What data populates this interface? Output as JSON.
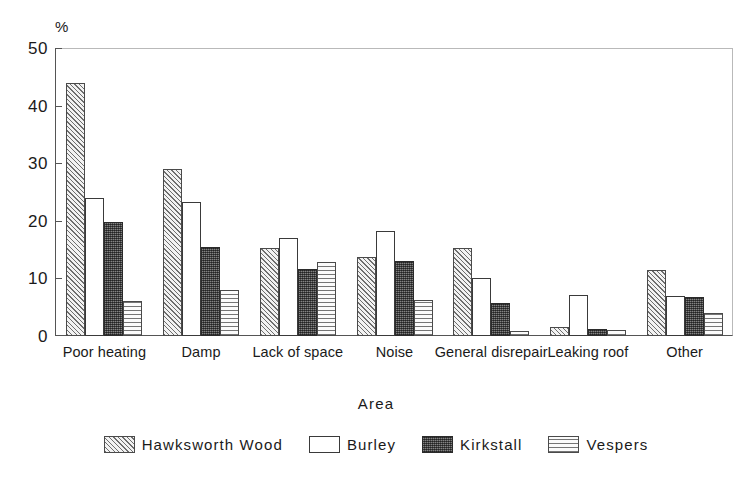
{
  "chart_data": {
    "type": "bar",
    "title": "",
    "xlabel": "Area",
    "ylabel": "%",
    "ylim": [
      0,
      50
    ],
    "yticks": [
      0,
      10,
      20,
      30,
      40,
      50
    ],
    "grid": false,
    "legend_position": "bottom",
    "legend_title": "Area",
    "categories": [
      "Poor heating",
      "Damp",
      "Lack of space",
      "Noise",
      "General disrepair",
      "Leaking roof",
      "Other"
    ],
    "series": [
      {
        "name": "Hawksworth Wood",
        "pattern": "diagonal-hatch",
        "values": [
          44.0,
          29.0,
          15.2,
          13.7,
          15.2,
          1.5,
          11.5
        ]
      },
      {
        "name": "Burley",
        "pattern": "open-white",
        "values": [
          24.0,
          23.2,
          17.0,
          18.3,
          10.0,
          7.2,
          7.0
        ]
      },
      {
        "name": "Kirkstall",
        "pattern": "dense-dark",
        "values": [
          19.8,
          15.5,
          11.7,
          13.0,
          5.7,
          1.3,
          6.7
        ]
      },
      {
        "name": "Vespers",
        "pattern": "horizontal-lines",
        "values": [
          6.0,
          8.0,
          12.9,
          6.2,
          0.8,
          1.1,
          4.0
        ]
      }
    ]
  },
  "axes": {
    "y_unit_label": "%",
    "y_tick_labels": [
      "0",
      "10",
      "20",
      "30",
      "40",
      "50"
    ],
    "x_axis_title": "Area"
  },
  "legend": {
    "items": [
      {
        "label": "Hawksworth Wood"
      },
      {
        "label": "Burley"
      },
      {
        "label": "Kirkstall"
      },
      {
        "label": "Vespers"
      }
    ]
  },
  "style": {
    "axis_color": "#555555",
    "frame_color": "#b9b9b9",
    "text_color": "#1a1a1a",
    "background": "#ffffff"
  }
}
